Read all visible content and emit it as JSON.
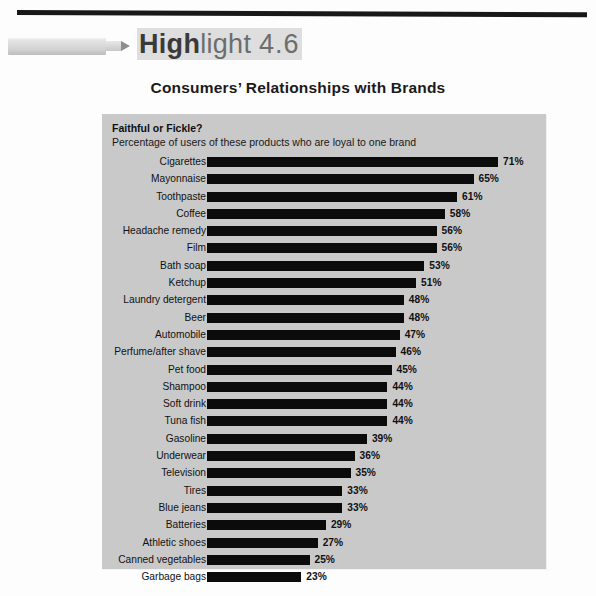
{
  "header": {
    "marker_icon": "highlighter-marker-icon",
    "title_bold": "High",
    "title_light": "light",
    "title_number": "4.6",
    "subtitle": "Consumers’ Relationships with Brands"
  },
  "panel": {
    "title": "Faithful or Fickle?",
    "subtitle": "Percentage of users of these products who are loyal to one brand",
    "background_color": "#c9c9c9",
    "bar_color": "#0b0b0b"
  },
  "chart_data": {
    "type": "bar",
    "orientation": "horizontal",
    "title": "Faithful or Fickle?",
    "subtitle": "Percentage of users of these products who are loyal to one brand",
    "xlabel": "",
    "ylabel": "",
    "xlim": [
      0,
      71
    ],
    "grid": false,
    "legend": null,
    "value_suffix": "%",
    "categories": [
      "Cigarettes",
      "Mayonnaise",
      "Toothpaste",
      "Coffee",
      "Headache remedy",
      "Film",
      "Bath soap",
      "Ketchup",
      "Laundry detergent",
      "Beer",
      "Automobile",
      "Perfume/after shave",
      "Pet food",
      "Shampoo",
      "Soft drink",
      "Tuna fish",
      "Gasoline",
      "Underwear",
      "Television",
      "Tires",
      "Blue jeans",
      "Batteries",
      "Athletic shoes",
      "Canned vegetables",
      "Garbage bags"
    ],
    "values": [
      71,
      65,
      61,
      58,
      56,
      56,
      53,
      51,
      48,
      48,
      47,
      46,
      45,
      44,
      44,
      44,
      39,
      36,
      35,
      33,
      33,
      29,
      27,
      25,
      23
    ],
    "value_labels": [
      "71%",
      "65%",
      "61%",
      "58%",
      "56%",
      "56%",
      "53%",
      "51%",
      "48%",
      "48%",
      "47%",
      "46%",
      "45%",
      "44%",
      "44%",
      "44%",
      "39%",
      "36%",
      "35%",
      "33%",
      "33%",
      "29%",
      "27%",
      "25%",
      "23%"
    ]
  }
}
